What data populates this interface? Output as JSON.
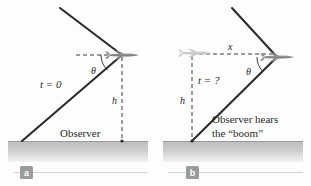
{
  "figure": {
    "background_color": "#fdfdfd",
    "ground_color": "#b9b9b9",
    "line_color": "#2b2b2b",
    "plane_color": "#8c8c8c",
    "plane_ghost_color": "#c9c9c9",
    "badge_color": "#9b9b9b",
    "badge_text_color": "#ffffff"
  },
  "panel_a": {
    "badge": "a",
    "labels": {
      "time": "t = 0",
      "angle": "θ",
      "height": "h",
      "observer": "Observer"
    },
    "icons": {
      "plane": "airplane-icon"
    }
  },
  "panel_b": {
    "badge": "b",
    "labels": {
      "distance": "x",
      "angle": "θ",
      "time": "t = ?",
      "height": "h",
      "observer_line1": "Observer hears",
      "observer_line2": "the “boom”"
    },
    "icons": {
      "plane": "airplane-icon",
      "plane_ghost": "airplane-ghost-icon"
    }
  }
}
